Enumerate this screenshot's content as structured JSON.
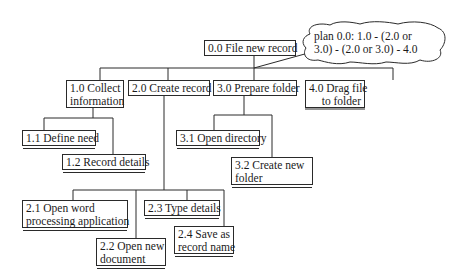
{
  "diagram": {
    "type": "hierarchical-task-analysis",
    "root": {
      "id": "0.0",
      "label": "0.0 File new record"
    },
    "plan": {
      "line1": "plan 0.0: 1.0 - (2.0 or",
      "line2": "3.0) - (2.0 or 3.0) - 4.0"
    },
    "tasks": {
      "t1": {
        "line1": "1.0 Collect",
        "line2": "information"
      },
      "t2": {
        "label": "2.0 Create record"
      },
      "t3": {
        "label": "3.0 Prepare folder"
      },
      "t4": {
        "line1": "4.0 Drag file",
        "line2": "to folder"
      }
    },
    "subtasks": {
      "t11": {
        "label": "1.1 Define need"
      },
      "t12": {
        "label": "1.2 Record details"
      },
      "t31": {
        "label": "3.1 Open directory"
      },
      "t32": {
        "line1": "3.2 Create new",
        "line2": "folder"
      },
      "t21": {
        "line1": "2.1 Open word",
        "line2": "processing application"
      },
      "t22": {
        "line1": "2.2 Open new",
        "line2": "document"
      },
      "t23": {
        "label": "2.3 Type details"
      },
      "t24": {
        "line1": "2.4 Save as",
        "line2": "record name"
      }
    }
  }
}
